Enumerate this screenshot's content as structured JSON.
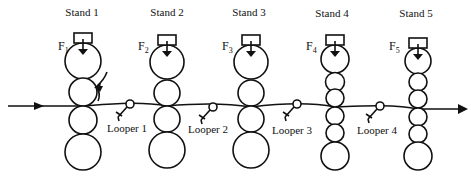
{
  "diagram": {
    "type": "tandem rolling mill schematic",
    "strip_direction": "left-to-right",
    "stands": [
      {
        "label": "Stand 1",
        "force_label": "F",
        "force_sub": "1",
        "x": 83,
        "rolls": [
          {
            "cy": 61,
            "r": 18
          },
          {
            "cy": 92,
            "r": 14
          },
          {
            "cy": 120,
            "r": 14
          },
          {
            "cy": 152,
            "r": 18
          }
        ]
      },
      {
        "label": "Stand 2",
        "force_label": "F",
        "force_sub": "2",
        "x": 167,
        "rolls": [
          {
            "cy": 62,
            "r": 17
          },
          {
            "cy": 93,
            "r": 13
          },
          {
            "cy": 119,
            "r": 13
          },
          {
            "cy": 150,
            "r": 18
          }
        ]
      },
      {
        "label": "Stand 3",
        "force_label": "F",
        "force_sub": "3",
        "x": 251,
        "rolls": [
          {
            "cy": 62,
            "r": 17
          },
          {
            "cy": 93,
            "r": 13
          },
          {
            "cy": 119,
            "r": 13
          },
          {
            "cy": 150,
            "r": 18
          }
        ]
      },
      {
        "label": "Stand 4",
        "force_label": "F",
        "force_sub": "4",
        "x": 335,
        "rolls": [
          {
            "cy": 59,
            "r": 14
          },
          {
            "cy": 82,
            "r": 9.5
          },
          {
            "cy": 98,
            "r": 9
          },
          {
            "cy": 116,
            "r": 9
          },
          {
            "cy": 133,
            "r": 9
          },
          {
            "cy": 156,
            "r": 14
          }
        ]
      },
      {
        "label": "Stand 5",
        "force_label": "F",
        "force_sub": "5",
        "x": 418,
        "rolls": [
          {
            "cy": 61,
            "r": 13
          },
          {
            "cy": 82,
            "r": 9
          },
          {
            "cy": 99,
            "r": 9
          },
          {
            "cy": 117,
            "r": 9
          },
          {
            "cy": 134,
            "r": 9
          },
          {
            "cy": 156,
            "r": 14
          }
        ]
      }
    ],
    "loopers": [
      {
        "label": "Looper 1",
        "x": 130,
        "y": 104
      },
      {
        "label": "Looper 2",
        "x": 213,
        "y": 107
      },
      {
        "label": "Looper 3",
        "x": 297,
        "y": 104
      },
      {
        "label": "Looper 4",
        "x": 380,
        "y": 106
      }
    ]
  },
  "labels": {
    "stand1": "Stand 1",
    "stand2": "Stand 2",
    "stand3": "Stand 3",
    "stand4": "Stand 4",
    "stand5": "Stand 5",
    "f": "F",
    "f1": "1",
    "f2": "2",
    "f3": "3",
    "f4": "4",
    "f5": "5",
    "looper1": "Looper 1",
    "looper2": "Looper 2",
    "looper3": "Looper 3",
    "looper4": "Looper 4"
  }
}
